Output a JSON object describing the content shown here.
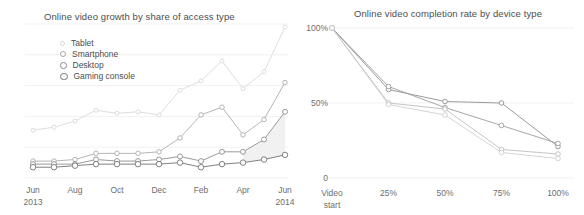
{
  "page": {
    "background": "#ffffff",
    "text_color": "#4d4d4d"
  },
  "charts": {
    "left": {
      "title": "Online video growth by share of access type",
      "legend": [
        {
          "label": "Tablet",
          "color": "#d4d4d4",
          "size": 5
        },
        {
          "label": "Smartphone",
          "color": "#a8a8a8",
          "size": 6
        },
        {
          "label": "Desktop",
          "color": "#8c8c8c",
          "size": 6.5
        },
        {
          "label": "Gaming console",
          "color": "#6e6e6e",
          "size": 7.5
        }
      ],
      "x_ticks": [
        {
          "label": "Jun",
          "sub": "2013"
        },
        {
          "label": "Aug",
          "sub": ""
        },
        {
          "label": "Oct",
          "sub": ""
        },
        {
          "label": "Dec",
          "sub": ""
        },
        {
          "label": "Feb",
          "sub": ""
        },
        {
          "label": "Apr",
          "sub": ""
        },
        {
          "label": "Jun",
          "sub": "2014"
        }
      ]
    },
    "right": {
      "title": "Online video completion rate by device type",
      "y_ticks": [
        "100%",
        "50%",
        "0"
      ],
      "x_ticks": [
        {
          "label": "Video",
          "sub": "start"
        },
        {
          "label": "25%",
          "sub": ""
        },
        {
          "label": "50%",
          "sub": ""
        },
        {
          "label": "75%",
          "sub": ""
        },
        {
          "label": "100%",
          "sub": ""
        }
      ]
    }
  },
  "chart_data": [
    {
      "type": "line",
      "id": "online-video-growth",
      "title": "Online video growth by share of access type",
      "xlabel": "",
      "ylabel": "",
      "grid": true,
      "legend_position": "inside-top-left",
      "categories": [
        "Jun 2013",
        "Jul 2013",
        "Aug 2013",
        "Sep 2013",
        "Oct 2013",
        "Nov 2013",
        "Dec 2013",
        "Jan 2014",
        "Feb 2014",
        "Mar 2014",
        "Apr 2014",
        "May 2014",
        "Jun 2014"
      ],
      "xlim": [
        0,
        12
      ],
      "ylim": [
        0,
        100
      ],
      "gridlines": [
        20,
        40,
        60,
        80,
        100
      ],
      "series": [
        {
          "name": "Tablet",
          "color": "#d9d9d9",
          "values": [
            31,
            33,
            37,
            44,
            42,
            43,
            41,
            57,
            63,
            76,
            58,
            69,
            98
          ]
        },
        {
          "name": "Smartphone",
          "color": "#adadad",
          "values": [
            11,
            11,
            12,
            16,
            16,
            16,
            17,
            26,
            41,
            46,
            28,
            38,
            62
          ]
        },
        {
          "name": "Desktop",
          "color": "#8f8f8f",
          "values": [
            9,
            9,
            9,
            12,
            11,
            11,
            12,
            14,
            11,
            17,
            17,
            25,
            43
          ]
        },
        {
          "name": "Gaming console",
          "color": "#737373",
          "values": [
            7,
            7,
            8,
            9,
            9,
            9,
            9,
            10,
            7,
            9,
            10,
            12,
            15
          ]
        }
      ],
      "shaded_region": {
        "from_category": "Apr 2014",
        "to_category": "Jun 2014",
        "color": "#efefef"
      }
    },
    {
      "type": "line",
      "id": "online-video-completion-rate",
      "title": "Online video completion rate by device type",
      "xlabel": "",
      "ylabel": "",
      "grid": true,
      "legend_position": "none",
      "categories": [
        "Video start",
        "25%",
        "50%",
        "75%",
        "100%"
      ],
      "xlim": [
        0,
        4
      ],
      "ylim": [
        0,
        100
      ],
      "gridlines": [
        0,
        50,
        100
      ],
      "ytick_values": [
        100,
        50,
        0
      ],
      "ytick_labels": [
        "100%",
        "50%",
        "0"
      ],
      "series": [
        {
          "name": "Series 1",
          "color": "#8f8f8f",
          "values": [
            100,
            59,
            51,
            50,
            21
          ]
        },
        {
          "name": "Series 2",
          "color": "#9c9c9c",
          "values": [
            100,
            61,
            47,
            35,
            23
          ]
        },
        {
          "name": "Series 3",
          "color": "#bdbdbd",
          "values": [
            100,
            50,
            46,
            19,
            16
          ]
        },
        {
          "name": "Series 4",
          "color": "#cfcfcf",
          "values": [
            100,
            49,
            42,
            17,
            13
          ]
        }
      ]
    }
  ]
}
